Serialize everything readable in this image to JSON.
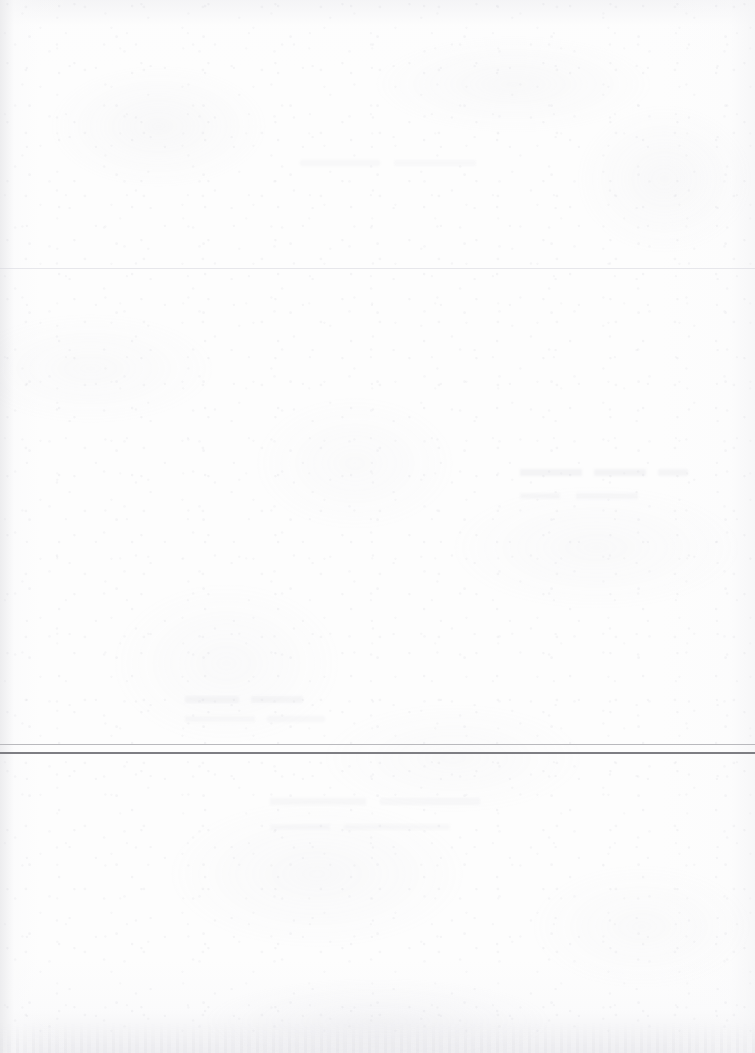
{
  "document": {
    "kind": "scanned-page",
    "page_state": "blank",
    "text_content": "",
    "visible_text_blocks": [],
    "background_color": "#fdfdfd",
    "page_width": 755,
    "page_height": 1053
  },
  "rules": [
    {
      "id": "faint-upper-rule",
      "label": "",
      "top": 268,
      "thickness": 1,
      "color": "#d6d6dc",
      "span": "full-width"
    },
    {
      "id": "lower-light-rule",
      "label": "",
      "top": 744,
      "thickness": 1.4,
      "color": "#b9b9bd",
      "span": "full-width"
    },
    {
      "id": "lower-dark-rule",
      "label": "",
      "top": 752,
      "thickness": 2,
      "color": "#7e7e83",
      "span": "full-width"
    }
  ],
  "artifacts": {
    "bleed_through": [
      {
        "id": "ghost-top-center",
        "label": "",
        "legible": false
      },
      {
        "id": "ghost-upper-right",
        "label": "",
        "legible": false
      },
      {
        "id": "ghost-mid-left",
        "label": "",
        "legible": false
      },
      {
        "id": "ghost-lower-center",
        "label": "",
        "legible": false
      }
    ],
    "scan_shadow_edges": [
      "left",
      "top",
      "right",
      "bottom"
    ]
  }
}
